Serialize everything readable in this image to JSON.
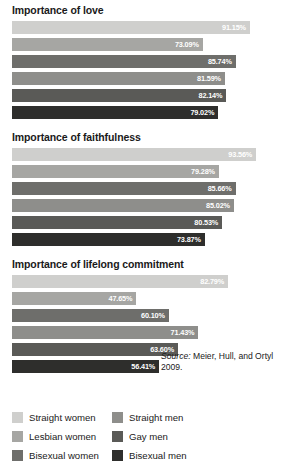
{
  "chart_data": {
    "type": "bar",
    "orientation": "horizontal",
    "title": "",
    "xlabel": "",
    "ylabel": "",
    "xlim": [
      0,
      100
    ],
    "grid": false,
    "legend_position": "bottom",
    "categories": [
      "Straight women",
      "Lesbian women",
      "Bisexual women",
      "Straight men",
      "Gay men",
      "Bisexual men"
    ],
    "colors": [
      "#cfcfcd",
      "#a6a6a3",
      "#6e6e6b",
      "#8e8e8b",
      "#5a5a57",
      "#2e2e2c"
    ],
    "panels": [
      {
        "title": "Importance of love",
        "values": [
          91.15,
          73.09,
          85.74,
          81.59,
          82.14,
          79.02
        ],
        "labels": [
          "91.15%",
          "73.09%",
          "85.74%",
          "81.59%",
          "82.14%",
          "79.02%"
        ]
      },
      {
        "title": "Importance of faithfulness",
        "values": [
          93.56,
          79.28,
          85.66,
          85.02,
          80.53,
          73.87
        ],
        "labels": [
          "93.56%",
          "79.28%",
          "85.66%",
          "85.02%",
          "80.53%",
          "73.87%"
        ]
      },
      {
        "title": "Importance of lifelong commitment",
        "values": [
          82.79,
          47.65,
          60.1,
          71.43,
          63.6,
          56.41
        ],
        "labels": [
          "82.79%",
          "47.65%",
          "60.10%",
          "71.43%",
          "63.60%",
          "56.41%"
        ]
      }
    ],
    "source_label": "Source:",
    "source_text": "Meier, Hull, and Ortyl 2009."
  },
  "legend": {
    "left_column": [
      {
        "label": "Straight women",
        "color": "#cfcfcd"
      },
      {
        "label": "Lesbian women",
        "color": "#a6a6a3"
      },
      {
        "label": "Bisexual women",
        "color": "#6e6e6b"
      }
    ],
    "right_column": [
      {
        "label": "Straight men",
        "color": "#8e8e8b"
      },
      {
        "label": "Gay men",
        "color": "#5a5a57"
      },
      {
        "label": "Bisexual men",
        "color": "#2e2e2c"
      }
    ]
  }
}
